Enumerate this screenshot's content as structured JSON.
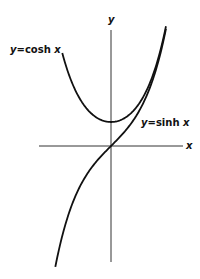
{
  "figure": {
    "axis_labels": {
      "x": "x",
      "y": "y"
    },
    "curves": [
      {
        "name": "cosh",
        "label_lhs": "y",
        "label_eq": "=",
        "label_func": "cosh",
        "label_var": "x"
      },
      {
        "name": "sinh",
        "label_lhs": "y",
        "label_eq": "=",
        "label_func": "sinh",
        "label_var": "x"
      }
    ],
    "colors": {
      "ink": "#111111",
      "axis": "#333333",
      "background": "#ffffff"
    }
  },
  "chart_data": {
    "type": "line",
    "title": "",
    "xlabel": "x",
    "ylabel": "y",
    "series": [
      {
        "name": "y = cosh x",
        "x": [
          -2.0,
          -1.5,
          -1.0,
          -0.5,
          0,
          0.5,
          1.0,
          1.5,
          2.1
        ],
        "values": [
          3.76,
          2.35,
          1.54,
          1.13,
          1.0,
          1.13,
          1.54,
          2.35,
          4.14
        ]
      },
      {
        "name": "y = sinh x",
        "x": [
          -2.3,
          -2.0,
          -1.5,
          -1.0,
          -0.5,
          0,
          0.5,
          1.0,
          1.5,
          2.1
        ],
        "values": [
          -4.94,
          -3.63,
          -2.13,
          -1.18,
          -0.52,
          0,
          0.52,
          1.18,
          2.13,
          4.02
        ]
      }
    ],
    "xlim": [
      -3,
      3
    ],
    "ylim": [
      -5,
      5
    ],
    "grid": false,
    "legend": "inline labels"
  }
}
